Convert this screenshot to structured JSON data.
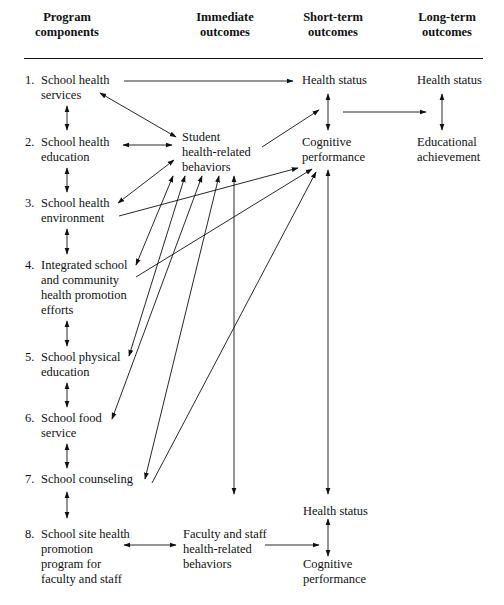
{
  "headers": {
    "program": [
      "Program",
      "components"
    ],
    "immediate": [
      "Immediate",
      "outcomes"
    ],
    "short_term": [
      "Short-term",
      "outcomes"
    ],
    "long_term": [
      "Long-term",
      "outcomes"
    ]
  },
  "components": [
    {
      "num": "1.",
      "lines": [
        "School health",
        "services"
      ]
    },
    {
      "num": "2.",
      "lines": [
        "School health",
        "education"
      ]
    },
    {
      "num": "3.",
      "lines": [
        "School health",
        "environment"
      ]
    },
    {
      "num": "4.",
      "lines": [
        "Integrated school",
        "and community",
        "health promotion",
        "efforts"
      ]
    },
    {
      "num": "5.",
      "lines": [
        "School physical",
        "education"
      ]
    },
    {
      "num": "6.",
      "lines": [
        "School food",
        "service"
      ]
    },
    {
      "num": "7.",
      "lines": [
        "School counseling"
      ]
    },
    {
      "num": "8.",
      "lines": [
        "School site health",
        "promotion",
        "program for",
        "faculty and staff"
      ]
    }
  ],
  "immediate": {
    "student": [
      "Student",
      "health-related",
      "behaviors"
    ],
    "faculty": [
      "Faculty and staff",
      "health-related",
      "behaviors"
    ]
  },
  "short_term": {
    "health_status_top": "Health status",
    "cognitive_top": [
      "Cognitive",
      "performance"
    ],
    "health_status_bottom": "Health status",
    "cognitive_bottom": [
      "Cognitive",
      "performance"
    ]
  },
  "long_term": {
    "health_status": "Health status",
    "educational": [
      "Educational",
      "achievement"
    ]
  }
}
